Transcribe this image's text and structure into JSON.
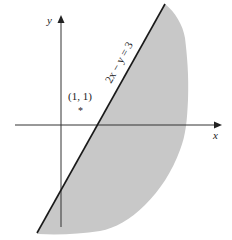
{
  "diagram": {
    "axes": {
      "x_label": "x",
      "y_label": "y"
    },
    "line": {
      "equation_label": "2x − y = 3",
      "color": "#1a1a1a"
    },
    "point": {
      "label": "(1, 1)",
      "marker": "*"
    },
    "shading": {
      "color": "#c8c8c8",
      "region": "right/below line 2x - y = 3"
    }
  }
}
